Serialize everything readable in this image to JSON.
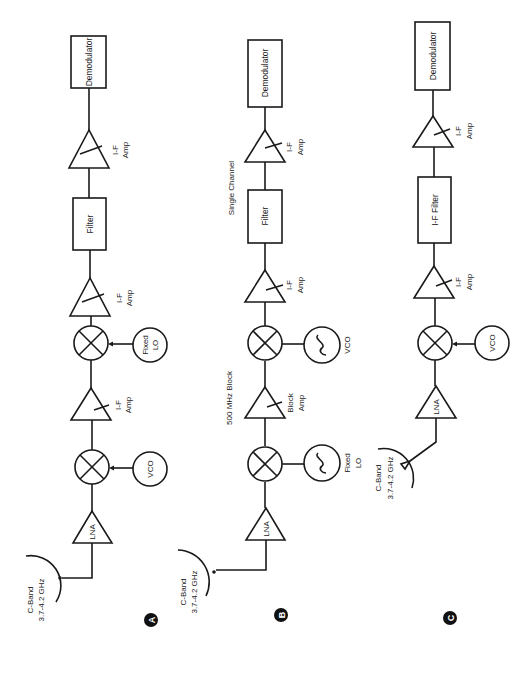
{
  "figure": {
    "orientation": "rotated-90-ccw",
    "colors": {
      "line": "#1a1a1a",
      "background": "#ffffff",
      "badge": "#111111"
    }
  },
  "diagrams": {
    "A": {
      "badge": "A",
      "antenna": {
        "band": "C-Band",
        "freq": "3.7-4.2 GHz"
      },
      "lna": "LNA",
      "mixer1_lo": "VCO",
      "amp1": {
        "line1": "I-F",
        "line2": "Amp"
      },
      "mixer2_lo": {
        "line1": "Fixed",
        "line2": "LO"
      },
      "amp2": {
        "line1": "I-F",
        "line2": "Amp"
      },
      "filter": "Filter",
      "amp3": {
        "line1": "I-F",
        "line2": "Amp"
      },
      "demodulator": "Demodulator"
    },
    "B": {
      "badge": "B",
      "antenna": {
        "band": "C-Band",
        "freq": "3.7-4.2 GHz"
      },
      "lna": "LNA",
      "mixer1_lo": {
        "line1": "Fixed",
        "line2": "LO"
      },
      "block_label": "500 MHz Block",
      "amp1": {
        "line1": "Block",
        "line2": "Amp"
      },
      "mixer2_lo": "VCO",
      "amp2": {
        "line1": "I-F",
        "line2": "Amp"
      },
      "channel_label": "Single Channel",
      "filter": "Filter",
      "amp3": {
        "line1": "I-F",
        "line2": "Amp"
      },
      "demodulator": "Demodulator"
    },
    "C": {
      "badge": "C",
      "antenna": {
        "band": "C-Band",
        "freq": "3.7-4.2 GHz"
      },
      "lna": "LNA",
      "mixer1_lo": "VCO",
      "amp1": {
        "line1": "I-F",
        "line2": "Amp"
      },
      "filter": "I-F Filter",
      "amp2": {
        "line1": "I-F",
        "line2": "Amp"
      },
      "demodulator": "Demodulator"
    }
  }
}
